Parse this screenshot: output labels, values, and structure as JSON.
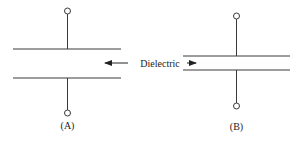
{
  "diagram": {
    "type": "capacitor-comparison",
    "colors": {
      "stroke": "#3a3a3a",
      "text": "#222222",
      "background": "#ffffff"
    },
    "dielectric_label": "Dielectric",
    "capacitors": [
      {
        "id": "A",
        "label": "(A)",
        "plate_separation": "wide"
      },
      {
        "id": "B",
        "label": "(B)",
        "plate_separation": "narrow"
      }
    ]
  }
}
